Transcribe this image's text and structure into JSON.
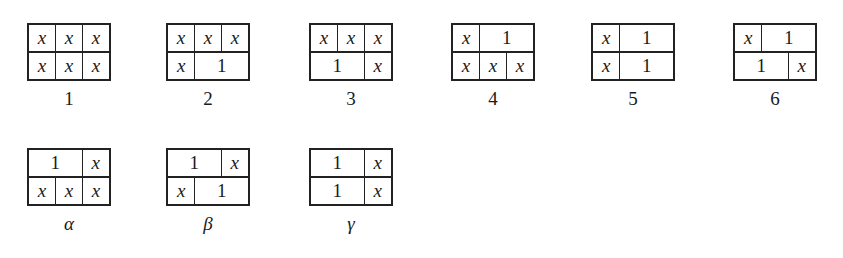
{
  "figures": [
    {
      "id": "1",
      "label": "1",
      "x": 27,
      "y": 23,
      "greek": false,
      "rows": [
        [
          {
            "t": "x",
            "s": 1
          },
          {
            "t": "x",
            "s": 1
          },
          {
            "t": "x",
            "s": 1
          }
        ],
        [
          {
            "t": "x",
            "s": 1
          },
          {
            "t": "x",
            "s": 1
          },
          {
            "t": "x",
            "s": 1
          }
        ]
      ]
    },
    {
      "id": "2",
      "label": "2",
      "x": 166,
      "y": 23,
      "greek": false,
      "rows": [
        [
          {
            "t": "x",
            "s": 1
          },
          {
            "t": "x",
            "s": 1
          },
          {
            "t": "x",
            "s": 1
          }
        ],
        [
          {
            "t": "x",
            "s": 1
          },
          {
            "t": "1",
            "s": 2
          }
        ]
      ]
    },
    {
      "id": "3",
      "label": "3",
      "x": 309,
      "y": 23,
      "greek": false,
      "rows": [
        [
          {
            "t": "x",
            "s": 1
          },
          {
            "t": "x",
            "s": 1
          },
          {
            "t": "x",
            "s": 1
          }
        ],
        [
          {
            "t": "1",
            "s": 2
          },
          {
            "t": "x",
            "s": 1
          }
        ]
      ]
    },
    {
      "id": "4",
      "label": "4",
      "x": 451,
      "y": 23,
      "greek": false,
      "rows": [
        [
          {
            "t": "x",
            "s": 1
          },
          {
            "t": "1",
            "s": 2
          }
        ],
        [
          {
            "t": "x",
            "s": 1
          },
          {
            "t": "x",
            "s": 1
          },
          {
            "t": "x",
            "s": 1
          }
        ]
      ]
    },
    {
      "id": "5",
      "label": "5",
      "x": 591,
      "y": 23,
      "greek": false,
      "rows": [
        [
          {
            "t": "x",
            "s": 1
          },
          {
            "t": "1",
            "s": 2
          }
        ],
        [
          {
            "t": "x",
            "s": 1
          },
          {
            "t": "1",
            "s": 2
          }
        ]
      ]
    },
    {
      "id": "6",
      "label": "6",
      "x": 733,
      "y": 23,
      "greek": false,
      "rows": [
        [
          {
            "t": "x",
            "s": 1
          },
          {
            "t": "1",
            "s": 2
          }
        ],
        [
          {
            "t": "1",
            "s": 2
          },
          {
            "t": "x",
            "s": 1
          }
        ]
      ]
    },
    {
      "id": "alpha",
      "label": "α",
      "x": 27,
      "y": 148,
      "greek": true,
      "rows": [
        [
          {
            "t": "1",
            "s": 2
          },
          {
            "t": "x",
            "s": 1
          }
        ],
        [
          {
            "t": "x",
            "s": 1
          },
          {
            "t": "x",
            "s": 1
          },
          {
            "t": "x",
            "s": 1
          }
        ]
      ]
    },
    {
      "id": "beta",
      "label": "β",
      "x": 166,
      "y": 148,
      "greek": true,
      "rows": [
        [
          {
            "t": "1",
            "s": 2
          },
          {
            "t": "x",
            "s": 1
          }
        ],
        [
          {
            "t": "x",
            "s": 1
          },
          {
            "t": "1",
            "s": 2
          }
        ]
      ]
    },
    {
      "id": "gamma",
      "label": "γ",
      "x": 309,
      "y": 148,
      "greek": true,
      "rows": [
        [
          {
            "t": "1",
            "s": 2
          },
          {
            "t": "x",
            "s": 1
          }
        ],
        [
          {
            "t": "1",
            "s": 2
          },
          {
            "t": "x",
            "s": 1
          }
        ]
      ]
    }
  ]
}
